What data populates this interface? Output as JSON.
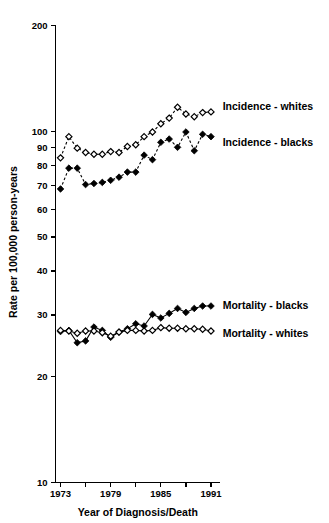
{
  "chart_data": {
    "type": "line",
    "title": "",
    "xlabel": "Year of Diagnosis/Death",
    "ylabel": "Rate per 100,000 person-years",
    "yscale": "log",
    "ylim": [
      10,
      200
    ],
    "xlim": [
      1972.4,
      1991.6
    ],
    "grid": false,
    "legend_position": "right-inline",
    "ytick_labels": [
      "10",
      "20",
      "30",
      "40",
      "50",
      "60",
      "70",
      "80",
      "90",
      "100",
      "200"
    ],
    "ytick_values": [
      10,
      20,
      30,
      40,
      50,
      60,
      70,
      80,
      90,
      100,
      200
    ],
    "xtick_values": [
      1973,
      1976,
      1979,
      1982,
      1985,
      1988,
      1991
    ],
    "xtick_labels": [
      "1973",
      "",
      "1979",
      "",
      "1985",
      "",
      "1991"
    ],
    "x": [
      1973,
      1974,
      1975,
      1976,
      1977,
      1978,
      1979,
      1980,
      1981,
      1982,
      1983,
      1984,
      1985,
      1986,
      1987,
      1988,
      1989,
      1990,
      1991
    ],
    "series": [
      {
        "name": "Incidence - whites",
        "marker": "open-diamond",
        "line": "dashed",
        "label_x": 1992.4,
        "label_y": 118,
        "values": [
          84.0,
          96.5,
          89.5,
          87.0,
          86.0,
          86.0,
          87.5,
          87.0,
          90.5,
          91.5,
          96.5,
          99.5,
          105.0,
          109.0,
          117.0,
          112.0,
          110.0,
          113.0,
          113.5
        ]
      },
      {
        "name": "Incidence - blacks",
        "marker": "filled-diamond",
        "line": "dashed",
        "label_x": 1992.4,
        "label_y": 93,
        "values": [
          68.5,
          78.5,
          78.5,
          70.5,
          71.0,
          71.5,
          72.5,
          74.0,
          76.5,
          76.5,
          85.5,
          83.0,
          93.0,
          95.0,
          90.0,
          99.5,
          88.0,
          98.0,
          96.5
        ]
      },
      {
        "name": "Mortality - blacks",
        "marker": "filled-diamond",
        "line": "solid",
        "label_x": 1992.4,
        "label_y": 32.0,
        "values": [
          26.9,
          27.1,
          25.0,
          25.3,
          27.7,
          27.1,
          25.9,
          26.8,
          27.4,
          28.3,
          27.9,
          30.1,
          29.4,
          30.3,
          31.3,
          30.5,
          31.3,
          31.8,
          31.8
        ]
      },
      {
        "name": "Mortality - whites",
        "marker": "open-diamond",
        "line": "solid",
        "label_x": 1992.4,
        "label_y": 26.5,
        "values": [
          27.1,
          27.0,
          26.6,
          27.0,
          27.0,
          26.7,
          26.1,
          26.8,
          27.1,
          27.1,
          27.0,
          27.1,
          27.6,
          27.5,
          27.5,
          27.4,
          27.4,
          27.3,
          27.0
        ]
      }
    ]
  }
}
